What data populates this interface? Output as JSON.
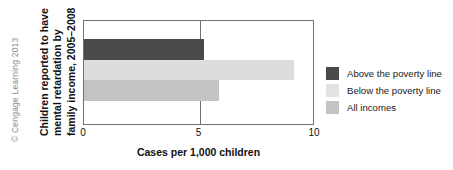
{
  "credit": "© Cengage Learning 2013",
  "chart_data": {
    "type": "bar",
    "orientation": "horizontal",
    "title": "",
    "ylabel_lines": [
      "Children reported to have",
      "mental retardation by",
      "family income, 2005–2008"
    ],
    "ylabel": "Children reported to have mental retardation by family income, 2005–2008",
    "xlabel": "Cases per 1,000 children",
    "categories": [
      "Above the poverty line",
      "Below the poverty line",
      "All incomes"
    ],
    "values": [
      5.2,
      9.1,
      5.85
    ],
    "xlim": [
      0,
      10
    ],
    "xticks": [
      0,
      5,
      10
    ],
    "xticklabels": [
      "0",
      "5",
      "10"
    ],
    "grid": "vertical gridline at 5",
    "legend_position": "right",
    "legend": [
      {
        "label": "Above the poverty line",
        "color": "#4a4a4a"
      },
      {
        "label": "Below the poverty line",
        "color": "#e2e2e2"
      },
      {
        "label": "All incomes",
        "color": "#c3c3c3"
      }
    ],
    "colors": {
      "above_the_poverty_line": "#4a4a4a",
      "below_the_poverty_line": "#dddddd",
      "all_incomes": "#c3c3c3",
      "axis": "#6f6f6f",
      "text": "#111111",
      "credit_text": "#8c8c8c"
    }
  }
}
